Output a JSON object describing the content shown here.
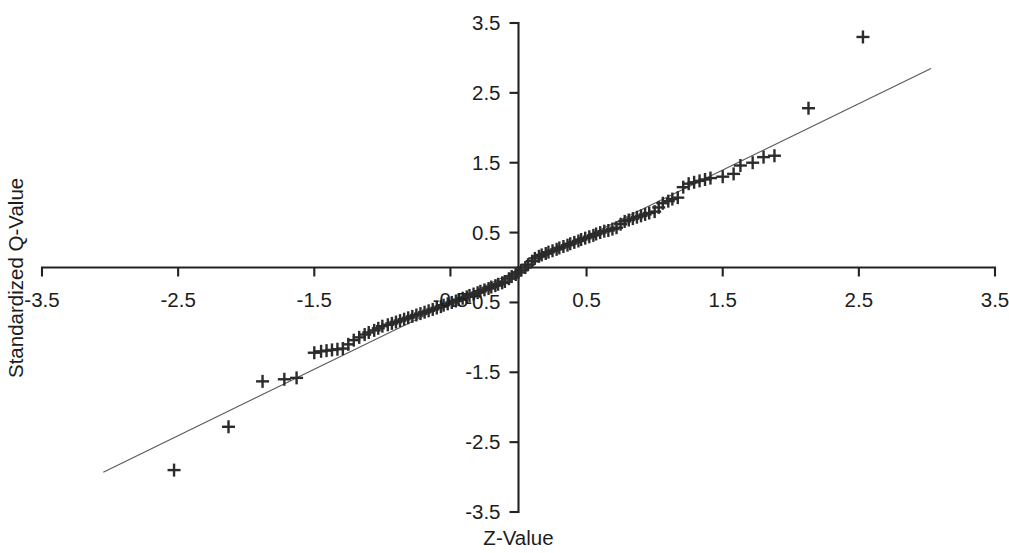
{
  "chart_data": {
    "type": "scatter",
    "title": "",
    "subtitle": "",
    "xlabel": "Z-Value",
    "ylabel": "Standardized Q-Value",
    "xlim": [
      -3.5,
      3.5
    ],
    "ylim": [
      -3.5,
      3.5
    ],
    "xticks": [
      -3.5,
      -2.5,
      -1.5,
      -0.5,
      0.5,
      1.5,
      2.5,
      3.5
    ],
    "xticklabels": [
      "-3.5",
      "-2.5",
      "-1.5",
      "-0.5",
      "0.5",
      "1.5",
      "2.5",
      "3.5"
    ],
    "yticks": [
      -3.5,
      -2.5,
      -1.5,
      -0.5,
      0.5,
      1.5,
      2.5,
      3.5
    ],
    "yticklabels": [
      "-3.5",
      "-2.5",
      "-1.5",
      "-0.5",
      "0.5",
      "1.5",
      "2.5",
      "3.5"
    ],
    "grid": false,
    "legend": false,
    "marker": "plus",
    "marker_color": "#2b2b2b",
    "axis_color": "#222222",
    "line_color": "#5a5a5a",
    "reference_line": {
      "label": "reference-line",
      "x0": -3.05,
      "y0": -2.93,
      "x1": 3.03,
      "y1": 2.85
    },
    "series": [
      {
        "name": "Q-Q points",
        "points": [
          [
            -2.53,
            -2.9
          ],
          [
            -2.13,
            -2.28
          ],
          [
            -1.88,
            -1.63
          ],
          [
            -1.72,
            -1.6
          ],
          [
            -1.63,
            -1.58
          ],
          [
            -1.5,
            -1.22
          ],
          [
            -1.45,
            -1.2
          ],
          [
            -1.41,
            -1.19
          ],
          [
            -1.37,
            -1.18
          ],
          [
            -1.33,
            -1.17
          ],
          [
            -1.29,
            -1.16
          ],
          [
            -1.25,
            -1.1
          ],
          [
            -1.21,
            -1.04
          ],
          [
            -1.17,
            -1.0
          ],
          [
            -1.13,
            -0.96
          ],
          [
            -1.1,
            -0.93
          ],
          [
            -1.06,
            -0.9
          ],
          [
            -1.03,
            -0.87
          ],
          [
            -1.0,
            -0.84
          ],
          [
            -0.96,
            -0.82
          ],
          [
            -0.93,
            -0.8
          ],
          [
            -0.9,
            -0.78
          ],
          [
            -0.87,
            -0.76
          ],
          [
            -0.84,
            -0.74
          ],
          [
            -0.81,
            -0.72
          ],
          [
            -0.78,
            -0.7
          ],
          [
            -0.75,
            -0.68
          ],
          [
            -0.72,
            -0.66
          ],
          [
            -0.69,
            -0.64
          ],
          [
            -0.66,
            -0.62
          ],
          [
            -0.63,
            -0.6
          ],
          [
            -0.6,
            -0.58
          ],
          [
            -0.57,
            -0.56
          ],
          [
            -0.55,
            -0.54
          ],
          [
            -0.52,
            -0.52
          ],
          [
            -0.49,
            -0.5
          ],
          [
            -0.46,
            -0.48
          ],
          [
            -0.44,
            -0.46
          ],
          [
            -0.41,
            -0.44
          ],
          [
            -0.38,
            -0.42
          ],
          [
            -0.36,
            -0.4
          ],
          [
            -0.33,
            -0.38
          ],
          [
            -0.3,
            -0.36
          ],
          [
            -0.28,
            -0.34
          ],
          [
            -0.25,
            -0.32
          ],
          [
            -0.22,
            -0.3
          ],
          [
            -0.2,
            -0.28
          ],
          [
            -0.17,
            -0.26
          ],
          [
            -0.15,
            -0.24
          ],
          [
            -0.12,
            -0.22
          ],
          [
            -0.1,
            -0.2
          ],
          [
            -0.07,
            -0.16
          ],
          [
            -0.05,
            -0.13
          ],
          [
            -0.02,
            -0.1
          ],
          [
            0.0,
            -0.07
          ],
          [
            0.02,
            -0.04
          ],
          [
            0.05,
            0.0
          ],
          [
            0.07,
            0.04
          ],
          [
            0.1,
            0.09
          ],
          [
            0.12,
            0.13
          ],
          [
            0.15,
            0.16
          ],
          [
            0.17,
            0.18
          ],
          [
            0.2,
            0.2
          ],
          [
            0.22,
            0.22
          ],
          [
            0.25,
            0.24
          ],
          [
            0.28,
            0.26
          ],
          [
            0.3,
            0.28
          ],
          [
            0.33,
            0.3
          ],
          [
            0.36,
            0.32
          ],
          [
            0.38,
            0.34
          ],
          [
            0.41,
            0.36
          ],
          [
            0.44,
            0.38
          ],
          [
            0.46,
            0.4
          ],
          [
            0.49,
            0.42
          ],
          [
            0.52,
            0.44
          ],
          [
            0.55,
            0.46
          ],
          [
            0.57,
            0.48
          ],
          [
            0.6,
            0.5
          ],
          [
            0.63,
            0.52
          ],
          [
            0.66,
            0.53
          ],
          [
            0.69,
            0.55
          ],
          [
            0.72,
            0.57
          ],
          [
            0.75,
            0.62
          ],
          [
            0.78,
            0.66
          ],
          [
            0.81,
            0.68
          ],
          [
            0.84,
            0.7
          ],
          [
            0.87,
            0.72
          ],
          [
            0.9,
            0.74
          ],
          [
            0.93,
            0.76
          ],
          [
            0.96,
            0.78
          ],
          [
            1.0,
            0.8
          ],
          [
            1.03,
            0.86
          ],
          [
            1.06,
            0.92
          ],
          [
            1.1,
            0.95
          ],
          [
            1.13,
            0.98
          ],
          [
            1.17,
            1.0
          ],
          [
            1.21,
            1.15
          ],
          [
            1.25,
            1.2
          ],
          [
            1.29,
            1.22
          ],
          [
            1.33,
            1.24
          ],
          [
            1.37,
            1.26
          ],
          [
            1.41,
            1.28
          ],
          [
            1.5,
            1.3
          ],
          [
            1.58,
            1.34
          ],
          [
            1.63,
            1.46
          ],
          [
            1.72,
            1.5
          ],
          [
            1.8,
            1.58
          ],
          [
            1.88,
            1.6
          ],
          [
            2.13,
            2.28
          ],
          [
            2.53,
            3.3
          ]
        ]
      }
    ]
  },
  "axes": {
    "x_title": "Z-Value",
    "y_title": "Standardized Q-Value"
  }
}
